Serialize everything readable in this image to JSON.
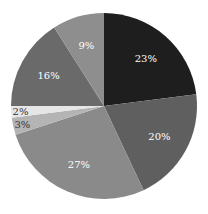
{
  "chart_data": {
    "type": "pie",
    "title": "",
    "start_angle_deg": 0,
    "direction": "clockwise",
    "labels_inside": true,
    "legend": "none",
    "slices": [
      {
        "label": "23%",
        "value": 23,
        "color": "#1e1e1e",
        "text_color": "#ffffff"
      },
      {
        "label": "20%",
        "value": 20,
        "color": "#5f5f5f",
        "text_color": "#ffffff"
      },
      {
        "label": "27%",
        "value": 27,
        "color": "#8a8a8a",
        "text_color": "#ffffff"
      },
      {
        "label": "3%",
        "value": 3,
        "color": "#b4b4b4",
        "text_color": "#333333"
      },
      {
        "label": "2%",
        "value": 2,
        "color": "#e6e6e6",
        "text_color": "#333333"
      },
      {
        "label": "16%",
        "value": 16,
        "color": "#6a6a6a",
        "text_color": "#ffffff"
      },
      {
        "label": "9%",
        "value": 9,
        "color": "#8e8e8e",
        "text_color": "#ffffff"
      }
    ]
  },
  "geometry": {
    "cx": 104,
    "cy": 106,
    "r": 93
  }
}
